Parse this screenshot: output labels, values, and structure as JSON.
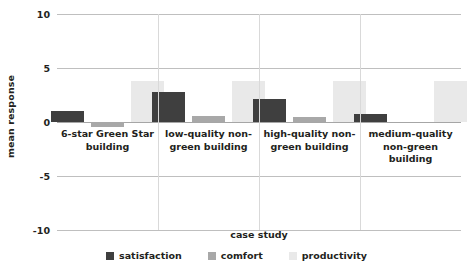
{
  "chart_data": {
    "type": "bar",
    "title": "",
    "xlabel": "case study",
    "ylabel": "mean response",
    "categories": [
      "6-star Green Star building",
      "low-quality non-green building",
      "high-quality non-green building",
      "medium-quality non-green building"
    ],
    "category_lines": [
      [
        "6-star Green Star",
        "building"
      ],
      [
        "low-quality non-",
        "green building"
      ],
      [
        "high-quality non-",
        "green building"
      ],
      [
        "medium-quality",
        "non-green building"
      ]
    ],
    "series": [
      {
        "name": "satisfaction",
        "color": "#3f3f3f",
        "values": [
          1.0,
          2.8,
          2.1,
          0.7
        ]
      },
      {
        "name": "comfort",
        "color": "#a8a8a8",
        "values": [
          -0.5,
          0.6,
          0.5,
          0.0
        ]
      },
      {
        "name": "productivity",
        "color": "#e9e9e9",
        "values": [
          3.8,
          3.8,
          3.8,
          3.8
        ]
      }
    ],
    "ylim": [
      -10,
      10
    ],
    "yticks": [
      10,
      5,
      0,
      -5,
      -10
    ],
    "ytick_labels": [
      "10",
      "5",
      "0",
      "-5",
      "-10"
    ],
    "grid": true,
    "legend_position": "bottom",
    "axis_color": "#bfbfbf",
    "text_color": "#231f20"
  }
}
